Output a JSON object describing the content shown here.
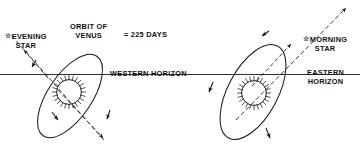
{
  "diagram": {
    "type": "astronomy-orbit-diagram",
    "background_color": "#ffffff",
    "line_color": "#1a1a1a",
    "labels": {
      "evening_star": {
        "star_glyph": "☆",
        "line1": "EVENING",
        "line2": "STAR"
      },
      "morning_star": {
        "star_glyph": "☆",
        "line1": "MORNING",
        "line2": "STAR"
      },
      "orbit": {
        "line1": "ORBIT OF",
        "line2": "VENUS",
        "equals": "= 225 DAYS"
      },
      "western_horizon": "WESTERN HORIZON",
      "eastern_horizon": {
        "line1": "EASTERN",
        "line2": "HORIZON"
      }
    },
    "elements": {
      "horizon_line_name": "horizon-line",
      "sun_left_name": "sun-symbol-west",
      "sun_right_name": "sun-symbol-east",
      "ellipse_left_name": "venus-orbit-ellipse-west",
      "ellipse_right_name": "venus-orbit-ellipse-east"
    },
    "values": {
      "orbital_period_days": 225
    }
  }
}
